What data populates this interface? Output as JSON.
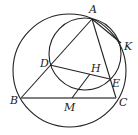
{
  "figure": {
    "type": "geometry-diagram",
    "circles": [
      {
        "name": "circumcircle",
        "cx": 69.5,
        "cy": 70.5,
        "r": 56.5
      },
      {
        "name": "small-circle",
        "cx": 85,
        "cy": 54,
        "r": 36
      }
    ],
    "points": {
      "A": {
        "label": "A",
        "x": 92,
        "y": 19,
        "lx": 89,
        "ly": 13
      },
      "B": {
        "label": "B",
        "x": 21,
        "y": 98,
        "lx": 11,
        "ly": 104
      },
      "C": {
        "label": "C",
        "x": 116,
        "y": 98,
        "lx": 119,
        "ly": 106
      },
      "D": {
        "label": "D",
        "x": 50,
        "y": 65,
        "lx": 40,
        "ly": 64
      },
      "E": {
        "label": "E",
        "x": 110,
        "y": 79,
        "lx": 113,
        "ly": 85
      },
      "H": {
        "label": "H",
        "x": 90,
        "y": 74,
        "lx": 91,
        "ly": 71
      },
      "M": {
        "label": "M",
        "x": 72,
        "y": 98,
        "lx": 64,
        "ly": 110
      },
      "K": {
        "label": "K",
        "x": 121,
        "y": 43,
        "lx": 124,
        "ly": 48
      }
    },
    "segments": [
      [
        "A",
        "B"
      ],
      [
        "A",
        "C"
      ],
      [
        "B",
        "C"
      ],
      [
        "D",
        "E"
      ],
      [
        "M",
        "H"
      ],
      [
        "A",
        "K"
      ]
    ]
  }
}
